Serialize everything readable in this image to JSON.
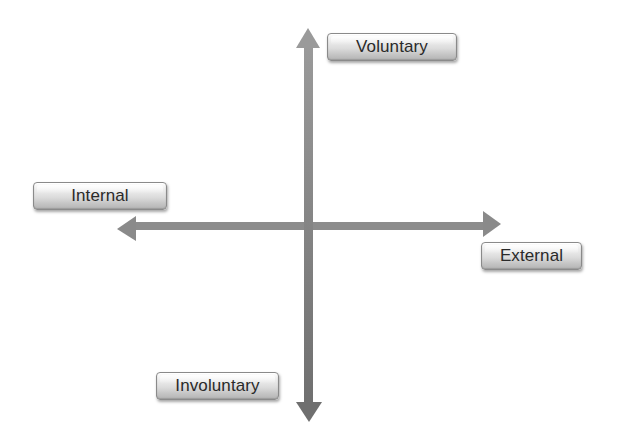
{
  "diagram": {
    "type": "two-axis quadrant diagram",
    "axes": {
      "vertical": {
        "positive_label": "Voluntary",
        "negative_label": "Involuntary"
      },
      "horizontal": {
        "negative_label": "Internal",
        "positive_label": "External"
      }
    },
    "labels": {
      "voluntary": "Voluntary",
      "internal": "Internal",
      "external": "External",
      "involuntary": "Involuntary"
    },
    "icons": {
      "up": "arrow-up-icon",
      "down": "arrow-down-icon",
      "left": "arrow-left-icon",
      "right": "arrow-right-icon"
    },
    "colors": {
      "arrow": "#8c8c8c",
      "arrow_dark": "#6e6e6e",
      "label_text": "#2a2a2a",
      "label_border": "#8a8a8a",
      "background": "#ffffff"
    }
  }
}
